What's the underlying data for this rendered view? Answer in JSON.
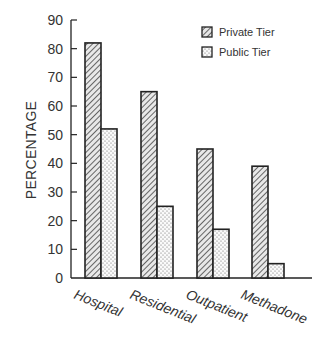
{
  "chart_data": {
    "type": "bar",
    "title": "",
    "xlabel": "",
    "ylabel": "PERCENTAGE",
    "ylim": [
      0,
      90
    ],
    "yticks": [
      0,
      10,
      20,
      30,
      40,
      50,
      60,
      70,
      80,
      90
    ],
    "grid": false,
    "legend_position": "upper right",
    "categories": [
      "Hospital",
      "Residential",
      "Outpatient",
      "Methadone"
    ],
    "series": [
      {
        "name": "Private Tier",
        "pattern": "diagonal-hatch",
        "values": [
          82,
          65,
          45,
          39
        ]
      },
      {
        "name": "Public Tier",
        "pattern": "dots",
        "values": [
          52,
          25,
          17,
          5
        ]
      }
    ]
  },
  "colors": {
    "ink": "#222222",
    "background": "#ffffff",
    "hatch": "#555555"
  }
}
